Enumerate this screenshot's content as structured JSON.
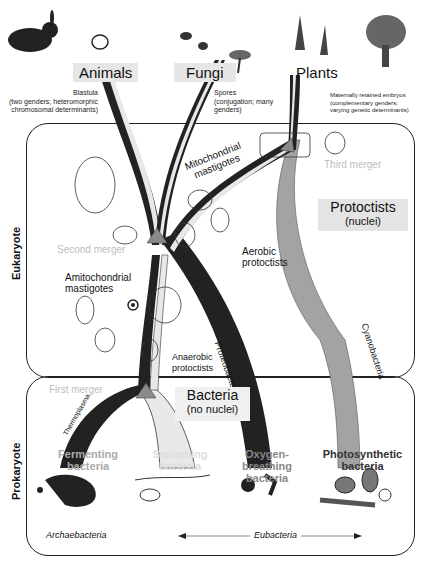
{
  "kingdoms": {
    "animals": "Animals",
    "fungi": "Fungi",
    "plants": "Plants"
  },
  "notes": {
    "animals_line1": "Blastula",
    "animals_line2": "(two genders; heteromorphic",
    "animals_line3": "chromosomal determinants)",
    "fungi_line1": "Spores",
    "fungi_line2": "(conjugation; many",
    "fungi_line3": "genders)",
    "plants_line1": "Maternally retained embryos",
    "plants_line2": "(complementary genders;",
    "plants_line3": "varying genetic determinants)"
  },
  "domains": {
    "eukaryote": "Eukaryote",
    "prokaryote": "Prokaryote"
  },
  "mergers": {
    "first": "First merger",
    "second": "Second merger",
    "third": "Third merger"
  },
  "labels": {
    "mito_line1": "Mitochondrial",
    "mito_line2": "mastigotes",
    "aerobic_line1": "Aerobic",
    "aerobic_line2": "protoctists",
    "amito_line1": "Amitochondrial",
    "amito_line2": "mastigotes",
    "anaerobic_line1": "Anaerobic",
    "anaerobic_line2": "protoctists",
    "proteobacteria": "Proteobacteria",
    "cyanobacteria": "Cyanobacteria",
    "thermoplasma": "Thermoplasma"
  },
  "groups": {
    "protoctists_title": "Protoctists",
    "protoctists_sub": "(nuclei)",
    "bacteria_title": "Bacteria",
    "bacteria_sub": "(no nuclei)"
  },
  "bacteria_types": {
    "fermenting_1": "Fermenting",
    "fermenting_2": "bacteria",
    "swimming_1": "Swimming",
    "swimming_2": "bacteria",
    "oxygen_1": "Oxygen-breathing",
    "oxygen_2": "bacteria",
    "photo_1": "Photosynthetic",
    "photo_2": "bacteria"
  },
  "footer": {
    "archaebacteria": "Archaebacteria",
    "eubacteria": "Eubacteria"
  },
  "colors": {
    "dark_branch": "#222222",
    "light_branch": "#e8e8e8",
    "gray_branch": "#a3a3a3",
    "merger_triangle": "#8a8a8a",
    "label_shade": "#e4e4e4",
    "merger_text": "#bdbdbd"
  }
}
